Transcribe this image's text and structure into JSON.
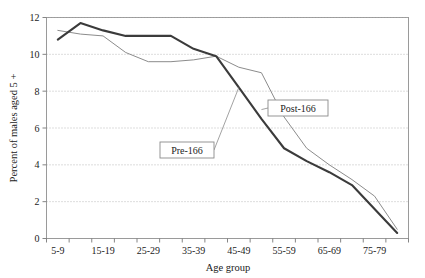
{
  "chart_data": {
    "type": "line",
    "title": "",
    "xlabel": "Age group",
    "ylabel": "Percent of males aged 5 +",
    "ylim": [
      0,
      12
    ],
    "yticks": [
      0,
      2,
      4,
      6,
      8,
      10,
      12
    ],
    "ytick_labels": [
      "0",
      "2",
      "4",
      "6",
      "8",
      "10",
      "12"
    ],
    "grid": "horizontal-dotted",
    "legend": "inline-callout-boxes",
    "categories": [
      "5-9",
      "10-14",
      "15-19",
      "20-24",
      "25-29",
      "30-34",
      "35-39",
      "40-44",
      "45-49",
      "50-54",
      "55-59",
      "60-64",
      "65-69",
      "70-74",
      "75-79",
      "80+"
    ],
    "xtick_labels_visible": [
      "5-9",
      "15-19",
      "25-29",
      "35-39",
      "45-49",
      "55-59",
      "65-69",
      "75-79"
    ],
    "series": [
      {
        "name": "Pre-166",
        "color": "#3b3b3b",
        "width": 2.1,
        "values": [
          10.8,
          11.7,
          11.3,
          11.0,
          11.0,
          11.0,
          10.3,
          9.9,
          8.2,
          6.5,
          4.9,
          4.2,
          3.6,
          2.9,
          1.6,
          0.3
        ]
      },
      {
        "name": "Post-166",
        "color": "#8c8c8c",
        "width": 1.0,
        "values": [
          11.3,
          11.1,
          11.0,
          10.1,
          9.6,
          9.6,
          9.7,
          9.9,
          9.3,
          9.0,
          6.6,
          4.9,
          4.0,
          3.2,
          2.3,
          0.5
        ]
      }
    ],
    "annotations": [
      {
        "text": "Post-166",
        "anchor_category": "50-54",
        "anchor_value": 7.0
      },
      {
        "text": "Pre-166",
        "anchor_category": "45-49",
        "anchor_value": 8.2
      }
    ]
  },
  "labels": {
    "ylabel": "Percent of males aged 5 +",
    "xlabel": "Age group",
    "post_label": "Post-166",
    "pre_label": "Pre-166"
  }
}
